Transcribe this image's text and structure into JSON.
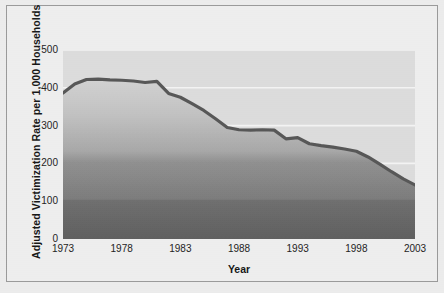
{
  "chart_data": {
    "type": "area",
    "title": "",
    "xlabel": "Year",
    "ylabel": "Adjusted Victimization Rate per 1,000 Households",
    "xlim": [
      1973,
      2003
    ],
    "ylim": [
      0,
      500
    ],
    "grid": true,
    "legend": "none",
    "x": [
      1973,
      1974,
      1975,
      1976,
      1977,
      1978,
      1979,
      1980,
      1981,
      1982,
      1983,
      1984,
      1985,
      1986,
      1987,
      1988,
      1989,
      1990,
      1991,
      1992,
      1993,
      1994,
      1995,
      1996,
      1997,
      1998,
      1999,
      2000,
      2001,
      2002,
      2003
    ],
    "values": [
      386,
      410,
      422,
      423,
      421,
      420,
      418,
      414,
      417,
      385,
      375,
      358,
      340,
      318,
      295,
      289,
      288,
      289,
      288,
      265,
      268,
      252,
      247,
      243,
      238,
      232,
      217,
      198,
      178,
      159,
      143
    ],
    "x_ticks": [
      1973,
      1978,
      1983,
      1988,
      1993,
      1998,
      2003
    ],
    "x_tick_labels": [
      "1973",
      "1978",
      "1983",
      "1988",
      "1993",
      "1998",
      "2003"
    ],
    "y_ticks": [
      0,
      100,
      200,
      300,
      400,
      500
    ],
    "y_tick_labels": [
      "0",
      "100",
      "200",
      "300",
      "400",
      "500"
    ],
    "colors": {
      "line": "#5a5a5a",
      "area_top": "#cfcfcf",
      "area_bottom": "#636363",
      "plot_background": "#dcdcdc",
      "gridline": "#f4f4f4",
      "figure_background": "#ededed",
      "figure_border": "#9a9a9a",
      "text": "#1d1d1d"
    }
  },
  "axes": {
    "y_title": "Adjusted Victimization Rate per 1,000 Households",
    "x_title": "Year"
  }
}
